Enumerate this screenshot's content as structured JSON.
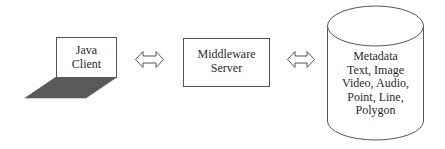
{
  "diagram": {
    "type": "architecture",
    "nodes": [
      {
        "id": "java-client",
        "shape": "box-with-shadow",
        "lines": [
          "Java",
          "Client"
        ]
      },
      {
        "id": "middleware-server",
        "shape": "box",
        "lines": [
          "Middleware",
          "Server"
        ]
      },
      {
        "id": "database",
        "shape": "cylinder",
        "lines": [
          "Metadata",
          "Text, Image",
          "Video, Audio,",
          "Point, Line,",
          "Polygon"
        ]
      }
    ],
    "edges": [
      {
        "from": "java-client",
        "to": "middleware-server",
        "style": "double-headed-hollow-arrow"
      },
      {
        "from": "middleware-server",
        "to": "database",
        "style": "double-headed-hollow-arrow"
      }
    ],
    "colors": {
      "stroke": "#555555",
      "shadow": "#555555",
      "text": "#2a2a2a",
      "background": "#ffffff"
    }
  }
}
